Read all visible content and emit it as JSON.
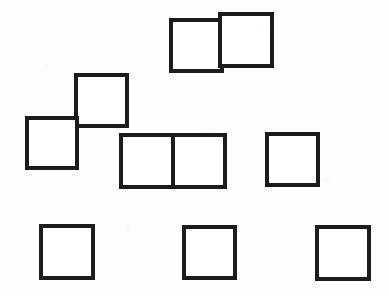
{
  "figure": {
    "canvas": {
      "width": 389,
      "height": 296,
      "background_color": "#fdfdfd"
    },
    "style": {
      "stroke_color": "#1c1c1c",
      "fill_color": "#ffffff",
      "stroke_width": 4
    },
    "square_count": 10,
    "group_count": 6,
    "groups": [
      {
        "name": "top-offset-pair",
        "description": "Two squares side by side, the right one shifted slightly upward",
        "square_count": 2
      },
      {
        "name": "diagonal-corner-pair",
        "description": "Two squares joined corner to corner in a diagonal step",
        "square_count": 2
      },
      {
        "name": "middle-domino",
        "description": "Two squares sharing a full vertical edge, forming a horizontal domino",
        "square_count": 2
      },
      {
        "name": "middle-right-single",
        "description": "Single isolated square at middle right",
        "square_count": 1
      },
      {
        "name": "bottom-row-singles",
        "description": "Three evenly spaced isolated squares along the bottom",
        "square_count": 3
      }
    ],
    "squares": [
      {
        "id": "square-top-left",
        "group": "top-offset-pair",
        "x": 171,
        "y": 20,
        "size": 51
      },
      {
        "id": "square-top-right",
        "group": "top-offset-pair",
        "x": 220,
        "y": 14,
        "size": 52
      },
      {
        "id": "square-diagonal-upper",
        "group": "diagonal-corner-pair",
        "x": 76,
        "y": 75,
        "size": 51
      },
      {
        "id": "square-diagonal-lower",
        "group": "diagonal-corner-pair",
        "x": 27,
        "y": 118,
        "size": 50
      },
      {
        "id": "square-domino-left",
        "group": "middle-domino",
        "x": 121,
        "y": 135,
        "size": 52
      },
      {
        "id": "square-domino-right",
        "group": "middle-domino",
        "x": 173,
        "y": 135,
        "size": 52
      },
      {
        "id": "square-middle-right",
        "group": "middle-right-single",
        "x": 267,
        "y": 134,
        "size": 51
      },
      {
        "id": "square-bottom-left",
        "group": "bottom-row-singles",
        "x": 41,
        "y": 226,
        "size": 52
      },
      {
        "id": "square-bottom-middle",
        "group": "bottom-row-singles",
        "x": 184,
        "y": 227,
        "size": 51
      },
      {
        "id": "square-bottom-right",
        "group": "bottom-row-singles",
        "x": 317,
        "y": 227,
        "size": 52
      }
    ],
    "dividers": [
      {
        "id": "domino-shared-edge",
        "x1": 173,
        "y1": 135,
        "x2": 173,
        "y2": 187
      }
    ]
  }
}
